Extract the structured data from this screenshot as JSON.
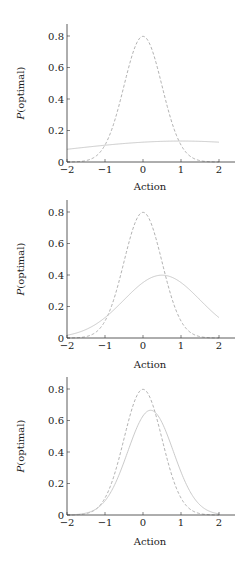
{
  "colors": {
    "axis": "#333333",
    "solid_line": "#c4c4c4",
    "dashed_line": "#a8a8a8",
    "text": "#1a1a1a"
  },
  "chart_data": [
    {
      "type": "line",
      "title": "",
      "xlabel": "Action",
      "ylabel": "P(optimal)",
      "xlim": [
        -2,
        2.4
      ],
      "ylim": [
        0,
        0.88
      ],
      "xticks": [
        -2,
        -1,
        0,
        1,
        2
      ],
      "xtick_labels": [
        "−2",
        "−1",
        "0",
        "1",
        "2"
      ],
      "yticks": [
        0,
        0.2,
        0.4,
        0.6,
        0.8
      ],
      "ytick_labels": [
        "0",
        "0.2",
        "0.4",
        "0.6",
        "0.8"
      ],
      "grid": false,
      "legend": null,
      "series": [
        {
          "name": "optimal (dashed)",
          "style": "dashed",
          "distribution": {
            "mean": 0,
            "std": 0.5
          },
          "x": [
            -2,
            -1.5,
            -1,
            -0.5,
            0,
            0.5,
            1,
            1.5,
            2
          ],
          "values": [
            0.0001,
            0.0089,
            0.108,
            0.484,
            0.798,
            0.484,
            0.108,
            0.0089,
            0.0001
          ]
        },
        {
          "name": "policy (solid)",
          "style": "solid",
          "distribution": {
            "mean": 1,
            "std": 3
          },
          "x": [
            -2,
            -1.5,
            -1,
            -0.5,
            0,
            0.5,
            1,
            1.5,
            2
          ],
          "values": [
            0.081,
            0.094,
            0.106,
            0.117,
            0.126,
            0.132,
            0.133,
            0.132,
            0.126
          ]
        }
      ]
    },
    {
      "type": "line",
      "title": "",
      "xlabel": "Action",
      "ylabel": "P(optimal)",
      "xlim": [
        -2,
        2.4
      ],
      "ylim": [
        0,
        0.88
      ],
      "xticks": [
        -2,
        -1,
        0,
        1,
        2
      ],
      "xtick_labels": [
        "−2",
        "−1",
        "0",
        "1",
        "2"
      ],
      "yticks": [
        0,
        0.2,
        0.4,
        0.6,
        0.8
      ],
      "ytick_labels": [
        "0",
        "0.2",
        "0.4",
        "0.6",
        "0.8"
      ],
      "grid": false,
      "legend": null,
      "series": [
        {
          "name": "optimal (dashed)",
          "style": "dashed",
          "distribution": {
            "mean": 0,
            "std": 0.5
          },
          "x": [
            -2,
            -1.5,
            -1,
            -0.5,
            0,
            0.5,
            1,
            1.5,
            2
          ],
          "values": [
            0.0001,
            0.0089,
            0.108,
            0.484,
            0.798,
            0.484,
            0.108,
            0.0089,
            0.0001
          ]
        },
        {
          "name": "policy (solid)",
          "style": "solid",
          "distribution": {
            "mean": 0.5,
            "std": 1
          },
          "x": [
            -2,
            -1.5,
            -1,
            -0.5,
            0,
            0.5,
            1,
            1.5,
            2
          ],
          "values": [
            0.018,
            0.054,
            0.13,
            0.242,
            0.352,
            0.399,
            0.352,
            0.242,
            0.13
          ]
        }
      ]
    },
    {
      "type": "line",
      "title": "",
      "xlabel": "Action",
      "ylabel": "P(optimal)",
      "xlim": [
        -2,
        2.4
      ],
      "ylim": [
        0,
        0.88
      ],
      "xticks": [
        -2,
        -1,
        0,
        1,
        2
      ],
      "xtick_labels": [
        "−2",
        "−1",
        "0",
        "1",
        "2"
      ],
      "yticks": [
        0,
        0.2,
        0.4,
        0.6,
        0.8
      ],
      "ytick_labels": [
        "0",
        "0.2",
        "0.4",
        "0.6",
        "0.8"
      ],
      "grid": false,
      "legend": null,
      "series": [
        {
          "name": "optimal (dashed)",
          "style": "dashed",
          "distribution": {
            "mean": 0,
            "std": 0.5
          },
          "x": [
            -2,
            -1.5,
            -1,
            -0.5,
            0,
            0.5,
            1,
            1.5,
            2
          ],
          "values": [
            0.0001,
            0.0089,
            0.108,
            0.484,
            0.798,
            0.484,
            0.108,
            0.0089,
            0.0001
          ]
        },
        {
          "name": "policy (solid)",
          "style": "solid",
          "distribution": {
            "mean": 0.2,
            "std": 0.6
          },
          "x": [
            -2,
            -1.5,
            -1,
            -0.5,
            0,
            0.5,
            1,
            1.5,
            2
          ],
          "values": [
            0.0008,
            0.0119,
            0.081,
            0.337,
            0.634,
            0.584,
            0.273,
            0.064,
            0.0082
          ]
        }
      ]
    }
  ],
  "layout": [
    {
      "axis_x0": 67,
      "axis_x1": 235,
      "axis_y_top": 24,
      "zero_y": 162,
      "label_y": 190
    },
    {
      "axis_x0": 67,
      "axis_x1": 235,
      "axis_y_top": 200,
      "zero_y": 338,
      "label_y": 368
    },
    {
      "axis_x0": 67,
      "axis_x1": 235,
      "axis_y_top": 377,
      "zero_y": 515,
      "label_y": 545
    }
  ]
}
